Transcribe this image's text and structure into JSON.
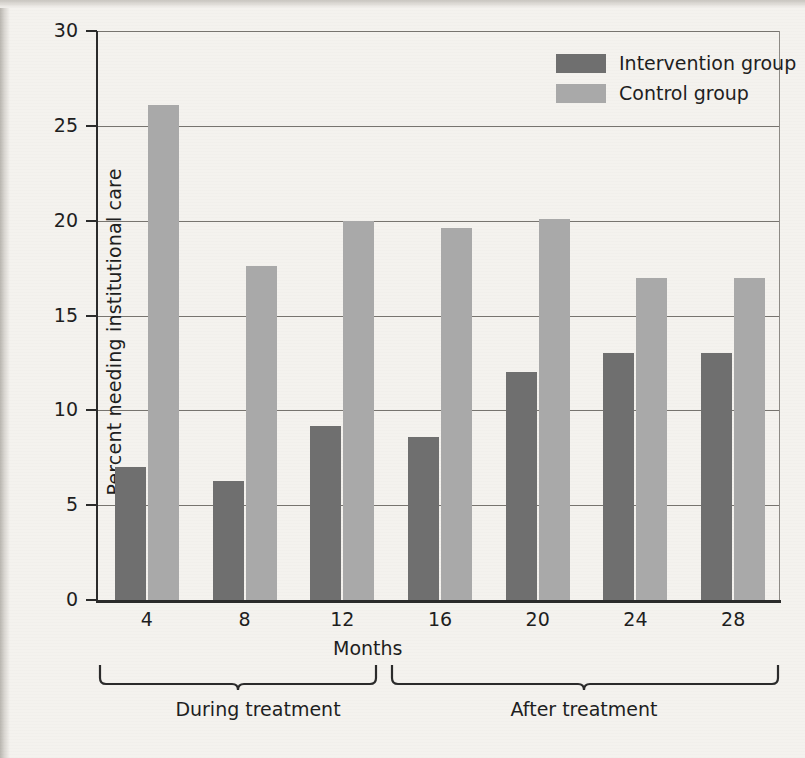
{
  "chart_data": {
    "type": "bar",
    "title": "",
    "xlabel": "Months",
    "ylabel": "Percent needing institutional care",
    "categories": [
      "4",
      "8",
      "12",
      "16",
      "20",
      "24",
      "28"
    ],
    "ylim": [
      0,
      30
    ],
    "yticks": [
      0,
      5,
      10,
      15,
      20,
      25,
      30
    ],
    "ytick_labels": [
      "0",
      "5",
      "10",
      "15",
      "20",
      "25",
      "30"
    ],
    "grid": "horizontal",
    "legend_position": "top-right",
    "series": [
      {
        "name": "Intervention group",
        "color": "#6f6f6f",
        "values": [
          7.0,
          6.3,
          9.2,
          8.6,
          12.0,
          13.0,
          13.0
        ]
      },
      {
        "name": "Control group",
        "color": "#a9a9a9",
        "values": [
          26.1,
          17.6,
          20.0,
          19.6,
          20.1,
          17.0,
          17.0
        ]
      }
    ],
    "annotations": [
      {
        "label": "During treatment",
        "spans": [
          "4",
          "8",
          "12"
        ]
      },
      {
        "label": "After treatment",
        "spans": [
          "16",
          "20",
          "24",
          "28"
        ]
      }
    ]
  },
  "legend": {
    "items": [
      {
        "label": "Intervention group",
        "color": "#6f6f6f"
      },
      {
        "label": "Control group",
        "color": "#a9a9a9"
      }
    ]
  },
  "axes": {
    "y_title": "Percent needing institutional care",
    "x_title": "Months",
    "y_labels": [
      "30",
      "25",
      "20",
      "15",
      "10",
      "5",
      "0"
    ],
    "x_labels": [
      "4",
      "8",
      "12",
      "16",
      "20",
      "24",
      "28"
    ]
  },
  "brackets": {
    "during": "During treatment",
    "after": "After treatment"
  },
  "colors": {
    "intervention": "#6f6f6f",
    "control": "#a9a9a9",
    "axis": "#2b2b2b",
    "grid": "#77746f",
    "background": "#f4f2ee",
    "text": "#1e1e1e"
  }
}
